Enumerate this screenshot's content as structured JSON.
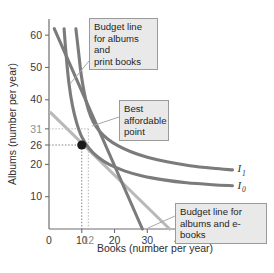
{
  "chart_data": {
    "type": "line",
    "title": "",
    "xlabel": "Books (number per year)",
    "ylabel": "Albums (number per year)",
    "xlim": [
      0,
      65
    ],
    "ylim": [
      0,
      65
    ],
    "grid": false,
    "x_ticks": [
      {
        "value": 0,
        "label": "0",
        "muted": false
      },
      {
        "value": 10,
        "label": "10",
        "muted": false
      },
      {
        "value": 12,
        "label": "12",
        "muted": true
      },
      {
        "value": 20,
        "label": "20",
        "muted": false
      },
      {
        "value": 30,
        "label": "30",
        "muted": false
      },
      {
        "value": 40,
        "label": "40",
        "muted": false
      },
      {
        "value": 50,
        "label": "50",
        "muted": false
      },
      {
        "value": 60,
        "label": "60",
        "muted": false
      }
    ],
    "y_ticks": [
      {
        "value": 10,
        "label": "10",
        "muted": false
      },
      {
        "value": 20,
        "label": "20",
        "muted": false
      },
      {
        "value": 26,
        "label": "26",
        "muted": false
      },
      {
        "value": 31,
        "label": "31",
        "muted": true
      },
      {
        "value": 40,
        "label": "40",
        "muted": false
      },
      {
        "value": 50,
        "label": "50",
        "muted": false
      },
      {
        "value": 60,
        "label": "60",
        "muted": false
      }
    ],
    "series": [
      {
        "name": "I1",
        "label": "I",
        "subscript": "1",
        "role": "indifference-curve-higher",
        "color": "#7b7b7b",
        "points": [
          [
            8.2,
            62.0
          ],
          [
            9.0,
            55.0
          ],
          [
            9.8,
            48.0
          ],
          [
            10.8,
            42.0
          ],
          [
            12.0,
            37.0
          ],
          [
            13.5,
            33.2
          ],
          [
            15.5,
            30.2
          ],
          [
            18.0,
            27.8
          ],
          [
            21.0,
            25.8
          ],
          [
            25.0,
            23.9
          ],
          [
            30.0,
            22.2
          ],
          [
            36.0,
            20.8
          ],
          [
            43.0,
            19.6
          ],
          [
            50.0,
            18.8
          ],
          [
            56.0,
            18.3
          ]
        ]
      },
      {
        "name": "I0",
        "label": "I",
        "subscript": "0",
        "role": "indifference-curve-lower",
        "color": "#7b7b7b",
        "points": [
          [
            4.6,
            62.0
          ],
          [
            5.3,
            53.0
          ],
          [
            6.1,
            45.0
          ],
          [
            7.1,
            38.5
          ],
          [
            8.4,
            33.0
          ],
          [
            10.0,
            28.5
          ],
          [
            12.2,
            25.0
          ],
          [
            15.0,
            22.2
          ],
          [
            18.5,
            19.9
          ],
          [
            23.0,
            18.0
          ],
          [
            28.5,
            16.4
          ],
          [
            35.0,
            15.2
          ],
          [
            42.0,
            14.3
          ],
          [
            50.0,
            13.7
          ],
          [
            56.0,
            13.4
          ]
        ]
      },
      {
        "name": "budget-albums-print-books",
        "role": "budget-line-print-books",
        "color": "#7b7b7b",
        "points": [
          [
            1.6,
            62.0
          ],
          [
            28.5,
            0.0
          ]
        ]
      },
      {
        "name": "budget-albums-ebooks",
        "role": "budget-line-ebooks",
        "color": "#b9b9b9",
        "points": [
          [
            0.5,
            36.0
          ],
          [
            36.8,
            0.0
          ]
        ]
      }
    ],
    "best_affordable_point": {
      "x": 10,
      "y": 26,
      "label": "best-affordable-point"
    },
    "guides": [
      {
        "from": [
          0,
          26
        ],
        "to": [
          10,
          26
        ],
        "style": "dotted-dark"
      },
      {
        "from": [
          10,
          26
        ],
        "to": [
          10,
          0
        ],
        "style": "dotted-dark"
      },
      {
        "from": [
          0,
          31
        ],
        "to": [
          12,
          31
        ],
        "style": "dotted-light"
      },
      {
        "from": [
          12,
          31
        ],
        "to": [
          12,
          0
        ],
        "style": "dotted-light"
      }
    ],
    "annotations": [
      {
        "name": "callout-budget-print-books",
        "text": "Budget line\nfor albums and\nprint books",
        "target": [
          12.5,
          40.0
        ]
      },
      {
        "name": "callout-best-affordable-point",
        "text": "Best\naffordable\npoint",
        "target": [
          10,
          26
        ]
      },
      {
        "name": "callout-budget-ebooks",
        "text": "Budget line for\nalbums and e-books",
        "target": [
          30.0,
          6.0
        ]
      }
    ],
    "curve_labels": [
      {
        "name": "label-I1",
        "base": "I",
        "sub": "1",
        "at": [
          57.5,
          18.6
        ]
      },
      {
        "name": "label-I0",
        "base": "I",
        "sub": "0",
        "at": [
          57.5,
          13.6
        ]
      }
    ],
    "colors": {
      "curve": "#7b7b7b",
      "budget_light": "#b9b9b9",
      "axis": "#6e6e6e",
      "point": "#1c1c1c",
      "callout_bg": "#e9e9e9",
      "callout_border": "#9a9a9a",
      "background": "#ffffff"
    }
  }
}
